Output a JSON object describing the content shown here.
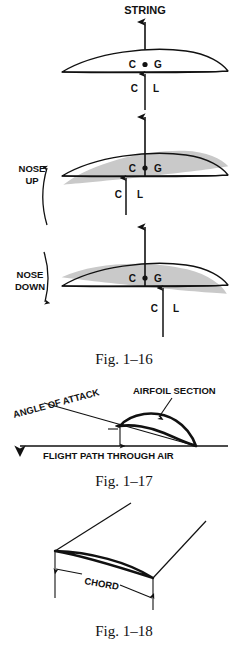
{
  "page": {
    "background_color": "#ffffff",
    "ink_color": "#111111",
    "shade_color": "#c9c9c9"
  },
  "figures": [
    {
      "id": "fig-1-16",
      "caption": "Fig. 1–16",
      "panels": [
        {
          "id": "balanced",
          "string_label": "STRING",
          "cg_left": "C",
          "cg_right": "G",
          "cl_left": "C",
          "cl_right": "L"
        },
        {
          "id": "nose-up",
          "rotation_label_line1": "NOSE",
          "rotation_label_line2": "UP",
          "cg_left": "C",
          "cg_right": "G",
          "cl_left": "C",
          "cl_right": "L"
        },
        {
          "id": "nose-down",
          "rotation_label_line1": "NOSE",
          "rotation_label_line2": "DOWN",
          "cg_left": "C",
          "cg_right": "G",
          "cl_left": "C",
          "cl_right": "L"
        }
      ]
    },
    {
      "id": "fig-1-17",
      "caption": "Fig. 1–17",
      "labels": {
        "airfoil_section": "AIRFOIL SECTION",
        "angle_of_attack": "ANGLE OF ATTACK",
        "flight_path": "FLIGHT PATH THROUGH AIR"
      }
    },
    {
      "id": "fig-1-18",
      "caption": "Fig. 1–18",
      "labels": {
        "chord": "CHORD"
      }
    }
  ]
}
